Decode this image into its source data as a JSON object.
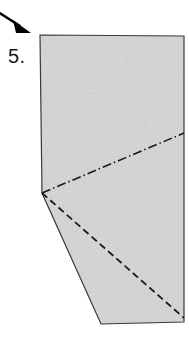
{
  "figure": {
    "kind": "origami-fold-diagram",
    "step_label": "5.",
    "canvas": {
      "width": 189,
      "height": 337,
      "background": "#ffffff"
    },
    "paper": {
      "name": "folded-paper-shape",
      "fill": "#d7d7d7",
      "stroke": "#3a3a3a",
      "stroke_width": 1.2,
      "texture": "stipple-noise",
      "vertices": [
        [
          40,
          35
        ],
        [
          184,
          36
        ],
        [
          184,
          322
        ],
        [
          101,
          324
        ],
        [
          42,
          193
        ]
      ]
    },
    "fold_lines": [
      {
        "name": "mountain-fold-line",
        "style": "dash-dot",
        "from": [
          42,
          193
        ],
        "to": [
          184,
          133
        ],
        "stroke": "#1a1a1a",
        "stroke_width": 1.6,
        "dash_pattern": "9 3 1.5 3"
      },
      {
        "name": "valley-fold-line",
        "style": "dashed",
        "from": [
          42,
          193
        ],
        "to": [
          184,
          318
        ],
        "stroke": "#1a1a1a",
        "stroke_width": 1.8,
        "dash_pattern": "7 4"
      }
    ],
    "arrow": {
      "name": "direction-arrow",
      "stroke": "#000000",
      "stroke_width": 2.4,
      "shaft_from": [
        -2,
        12
      ],
      "shaft_to": [
        20,
        26
      ],
      "head_points": "13,20 31,33 16,33",
      "direction": "down-right"
    }
  }
}
